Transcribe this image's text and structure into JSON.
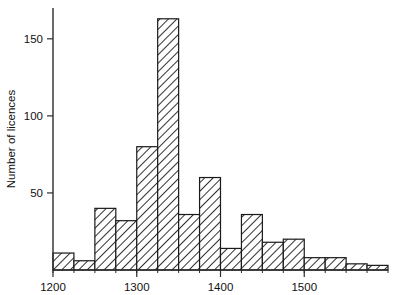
{
  "chart_data": {
    "type": "bar",
    "title": "",
    "subtitle": "",
    "xlabel": "",
    "ylabel": "Number of licences",
    "xlim": [
      1200,
      1600
    ],
    "ylim": [
      0,
      170
    ],
    "bin_width": 25,
    "grid": false,
    "legend": null,
    "legend_position": "none",
    "x_tick_labels": [
      "1200",
      "1300",
      "1400",
      "1500"
    ],
    "x_tick_values": [
      1200,
      1300,
      1400,
      1500
    ],
    "x_minor_tick_step": 25,
    "y_tick_labels": [
      "50",
      "100",
      "150"
    ],
    "y_tick_values": [
      50,
      100,
      150
    ],
    "bin_edges": [
      1200,
      1225,
      1250,
      1275,
      1300,
      1325,
      1350,
      1375,
      1400,
      1425,
      1450,
      1475,
      1500,
      1525,
      1550,
      1575,
      1600
    ],
    "categories": [
      "1200-1225",
      "1225-1250",
      "1250-1275",
      "1275-1300",
      "1300-1325",
      "1325-1350",
      "1350-1375",
      "1375-1400",
      "1400-1425",
      "1425-1450",
      "1450-1475",
      "1475-1500",
      "1500-1525",
      "1525-1550",
      "1550-1575",
      "1575-1600"
    ],
    "values": [
      11,
      6,
      40,
      32,
      80,
      163,
      36,
      60,
      14,
      36,
      18,
      20,
      8,
      8,
      4,
      3
    ],
    "bar_style": "diagonal-hatch",
    "bar_fill_color": "#ffffff",
    "bar_hatch_color": "#1a1a1a",
    "axis_color": "#2b2b2b"
  }
}
